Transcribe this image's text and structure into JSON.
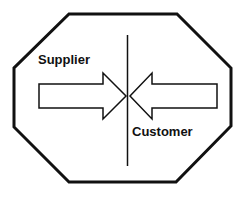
{
  "diagram": {
    "shape": "octagon",
    "labels": {
      "left": "Supplier",
      "right": "Customer"
    },
    "arrows": [
      {
        "from": "Supplier",
        "direction": "right"
      },
      {
        "from": "Customer",
        "direction": "left"
      }
    ],
    "divider": "vertical-line",
    "colors": {
      "stroke": "#111111",
      "fill": "#ffffff"
    }
  }
}
